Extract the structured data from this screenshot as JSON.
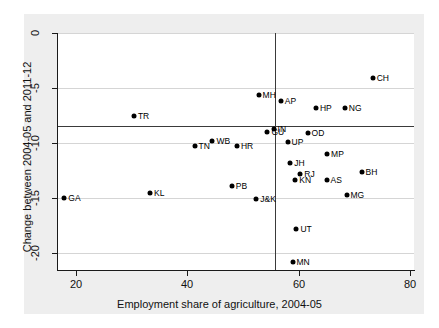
{
  "chart_data": {
    "type": "scatter",
    "title": "",
    "xlabel": "Employment share of agriculture, 2004-05",
    "ylabel": "Change between 2004-05 and 2011-12",
    "xlim": [
      16.5,
      80.5
    ],
    "ylim": [
      -21.5,
      0.8
    ],
    "xticks": [
      20,
      40,
      60,
      80
    ],
    "yticks": [
      0,
      -5,
      -10,
      -15,
      -20
    ],
    "xtick_labels": [
      "20",
      "40",
      "60",
      "80"
    ],
    "ytick_labels": [
      "0",
      "-5",
      "-10",
      "-15",
      "-20"
    ],
    "grid": "horizontal",
    "legend": "none",
    "reference_lines": {
      "horizontal_y": -8.7,
      "vertical_x": 55.5
    },
    "points": [
      {
        "label": "CH",
        "x": 73.3,
        "y": -4.1
      },
      {
        "label": "MH",
        "x": 52.8,
        "y": -5.6
      },
      {
        "label": "AP",
        "x": 56.8,
        "y": -6.2
      },
      {
        "label": "HP",
        "x": 63.1,
        "y": -6.8
      },
      {
        "label": "NG",
        "x": 68.3,
        "y": -6.8
      },
      {
        "label": "TR",
        "x": 30.4,
        "y": -7.5
      },
      {
        "label": "GU",
        "x": 54.4,
        "y": -9.0
      },
      {
        "label": "OD",
        "x": 61.6,
        "y": -9.1
      },
      {
        "label": "WB",
        "x": 44.5,
        "y": -9.8
      },
      {
        "label": "UP",
        "x": 58.0,
        "y": -9.9
      },
      {
        "label": "TN",
        "x": 41.3,
        "y": -10.3
      },
      {
        "label": "HR",
        "x": 48.9,
        "y": -10.3
      },
      {
        "label": "IN",
        "x": 55.5,
        "y": -8.7
      },
      {
        "label": "MP",
        "x": 65.1,
        "y": -11.0
      },
      {
        "label": "JH",
        "x": 58.5,
        "y": -11.8
      },
      {
        "label": "BH",
        "x": 71.3,
        "y": -12.6
      },
      {
        "label": "RJ",
        "x": 60.3,
        "y": -12.8
      },
      {
        "label": "KN",
        "x": 59.4,
        "y": -13.4
      },
      {
        "label": "AS",
        "x": 65.0,
        "y": -13.4
      },
      {
        "label": "PB",
        "x": 48.0,
        "y": -13.9
      },
      {
        "label": "KL",
        "x": 33.3,
        "y": -14.5
      },
      {
        "label": "MG",
        "x": 68.6,
        "y": -14.7
      },
      {
        "label": "J&K",
        "x": 52.4,
        "y": -15.1
      },
      {
        "label": "GA",
        "x": 17.9,
        "y": -15.0
      },
      {
        "label": "UT",
        "x": 59.6,
        "y": -17.8
      },
      {
        "label": "MN",
        "x": 58.9,
        "y": -20.8
      }
    ]
  },
  "axis": {
    "x_title": "Employment share of agriculture, 2004-05",
    "y_title": "Change between 2004-05 and 2011-12",
    "x_ticks": [
      "20",
      "40",
      "60",
      "80"
    ],
    "y_ticks": [
      "0",
      "-5",
      "-10",
      "-15",
      "-20"
    ]
  },
  "colors": {
    "marker": "#000000",
    "gridline": "#d5d5d5",
    "reference_line": "#3a3a3a",
    "axis": "#1a1a1a",
    "plot_background": "#ffffff",
    "page_background": "#eeeeee"
  }
}
